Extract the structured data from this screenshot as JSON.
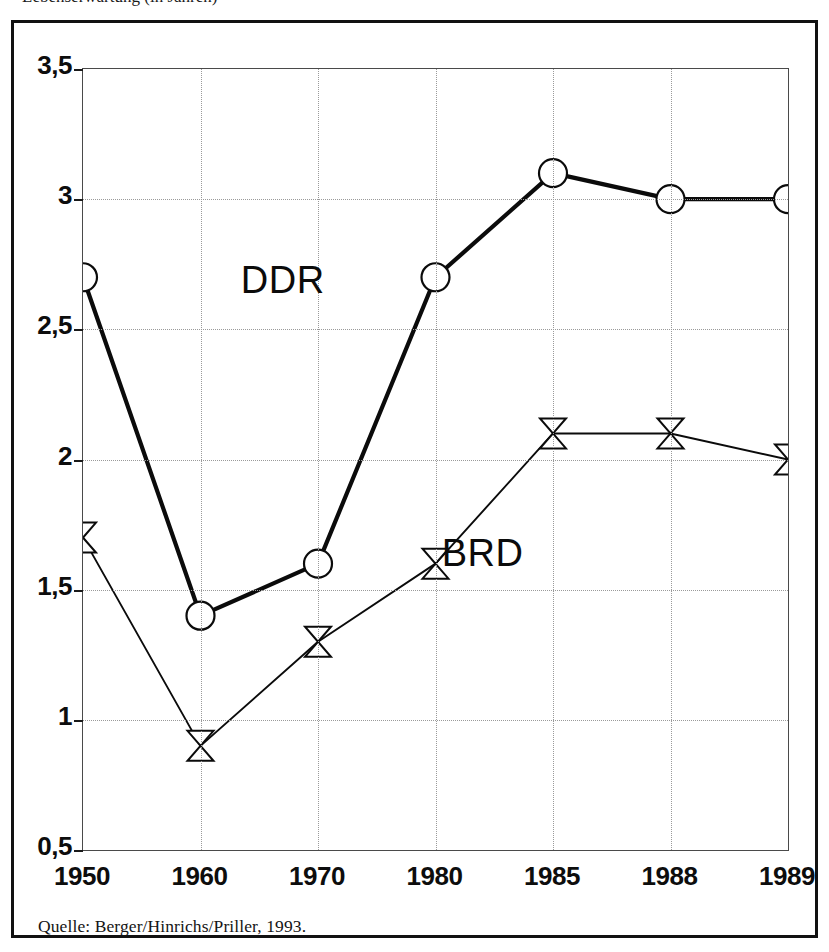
{
  "figure": {
    "top_caption_clipped": "Lebenserwartung (in Jahren)",
    "source_note": "Quelle: Berger/Hinrichs/Priller, 1993.",
    "frame_color": "#111111"
  },
  "chart_data": {
    "type": "line",
    "title": "",
    "subtitle": "",
    "xlabel": "",
    "ylabel": "",
    "categories": [
      "1950",
      "1960",
      "1970",
      "1980",
      "1985",
      "1988",
      "1989"
    ],
    "x_tick_labels": [
      "1950",
      "1960",
      "1970",
      "1980",
      "1985",
      "1988",
      "1989"
    ],
    "y_tick_labels": [
      "3,5",
      "3",
      "2,5",
      "2",
      "1,5",
      "1",
      "0,5"
    ],
    "y_tick_values": [
      3.5,
      3.0,
      2.5,
      2.0,
      1.5,
      1.0,
      0.5
    ],
    "ylim": [
      0.5,
      3.5
    ],
    "grid": true,
    "legend_position": "inline-annotations",
    "series": [
      {
        "name": "DDR",
        "marker": "open-circle",
        "line_width": "thick",
        "color": "#0b0b0b",
        "values": [
          2.7,
          1.4,
          1.6,
          2.7,
          3.1,
          3.0,
          3.0
        ],
        "annotation": {
          "text": "DDR",
          "x": "1967",
          "y": 2.69
        }
      },
      {
        "name": "BRD",
        "marker": "bowtie",
        "line_width": "thin",
        "color": "#0b0b0b",
        "values": [
          1.7,
          0.9,
          1.3,
          1.6,
          2.1,
          2.1,
          2.0
        ],
        "annotation": {
          "text": "BRD",
          "x": "1982",
          "y": 1.64
        }
      }
    ]
  }
}
